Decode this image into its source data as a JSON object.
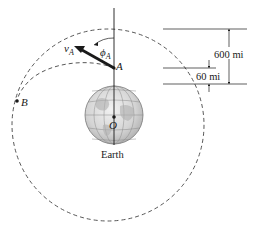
{
  "figure": {
    "type": "orbital-mechanics-diagram",
    "labels": {
      "velocity": "v",
      "velocity_sub": "A",
      "angle": "ϕ",
      "angle_sub": "A",
      "point_a": "A",
      "point_b": "B",
      "center": "O",
      "planet": "Earth"
    },
    "dimensions": {
      "outer": "600 mi",
      "inner": "60 mi"
    },
    "colors": {
      "line": "#1a1a1a",
      "dashed": "#444444",
      "earth_fill": "#d9d9d9",
      "earth_grid": "#8a8a8a",
      "background": "#ffffff"
    }
  }
}
